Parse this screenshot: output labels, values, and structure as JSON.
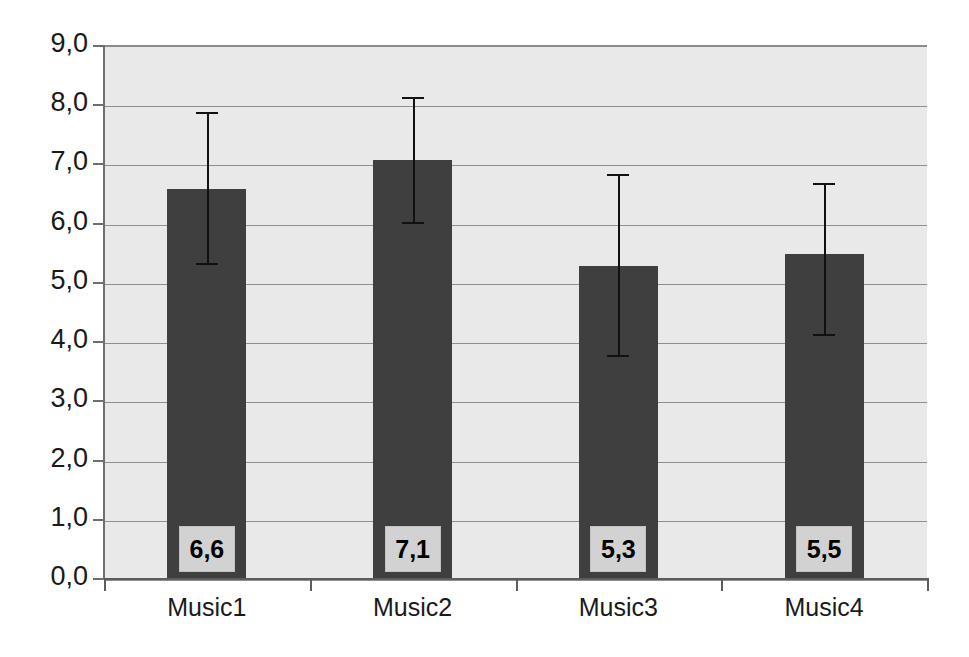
{
  "chart_data": {
    "type": "bar",
    "title": "",
    "subtitle": "",
    "xlabel": "",
    "ylabel": "",
    "categories": [
      "Music1",
      "Music2",
      "Music3",
      "Music4"
    ],
    "values": [
      6.6,
      7.1,
      5.3,
      5.5
    ],
    "value_labels": [
      "6,6",
      "7,1",
      "5,3",
      "5,5"
    ],
    "error_bars": {
      "present": true,
      "upper": [
        7.9,
        8.15,
        6.85,
        6.7
      ],
      "lower": [
        5.35,
        6.05,
        3.8,
        4.15
      ]
    },
    "ylim": [
      0,
      9
    ],
    "ytick_values": [
      0,
      1,
      2,
      3,
      4,
      5,
      6,
      7,
      8,
      9
    ],
    "ytick_labels": [
      "0,0",
      "1,0",
      "2,0",
      "3,0",
      "4,0",
      "5,0",
      "6,0",
      "7,0",
      "8,0",
      "9,0"
    ],
    "decimal_separator": ",",
    "grid": true,
    "grid_axis": "y",
    "legend": null,
    "legend_position": "none",
    "colors": {
      "bar_fill": "#3f3f3f",
      "plot_background": "#e9e9e9",
      "figure_background": "#ffffff",
      "gridline": "#8f8f8f",
      "axis_line": "#5d5d5d",
      "error_bar": "#111111",
      "data_label_background": "#d2d2d2",
      "data_label_text": "#000000",
      "tick_label_text": "#1a1a1a"
    }
  },
  "artifacts": {
    "show_through_text_top": "unreadable show-through text",
    "show_through_text_middle": "unreadable show-through text"
  }
}
